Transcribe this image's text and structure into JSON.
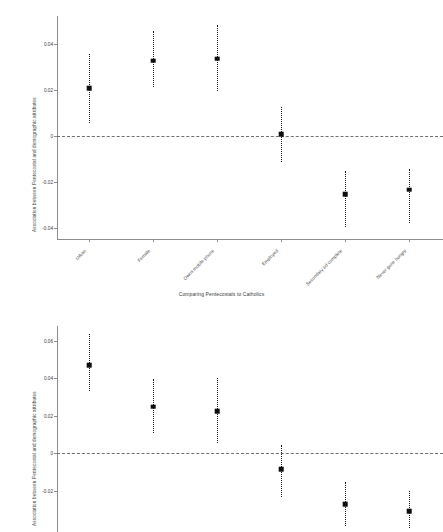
{
  "figure": {
    "caption": "Comparing Pentecostals to Catholics",
    "ylabel": "Association between Pentecostal and demographic attributes",
    "marker_color": "#0d0d0d",
    "errorbar_color": "#1a1a1a",
    "zeroline_color": "#6f6f6f",
    "axis_color": "#8d8d8d"
  },
  "chart_data": [
    {
      "type": "scatter",
      "panel": "top",
      "title": "",
      "subtitle": "Comparing Pentecostals to Catholics",
      "xlabel": "",
      "ylabel": "Association between Pentecostal and demographic attributes",
      "categories": [
        "Urban",
        "Female",
        "Owns mobile phone",
        "Employed",
        "Secondary ed complete",
        "Never gone hungry"
      ],
      "values": [
        0.0205,
        0.0325,
        0.0335,
        0.0007,
        -0.0255,
        -0.0235
      ],
      "ci_low": [
        0.0055,
        0.021,
        0.0195,
        -0.0115,
        -0.04,
        -0.038
      ],
      "ci_high": [
        0.0355,
        0.0455,
        0.048,
        0.0125,
        -0.0155,
        -0.0145
      ],
      "yticks": [
        0.04,
        0.02,
        0,
        -0.02,
        -0.04
      ],
      "ytick_labels": [
        "0.04",
        "0.02",
        "0",
        "-0.02",
        "-0.04"
      ],
      "ylim": [
        -0.045,
        0.052
      ],
      "grid": false,
      "legend": "none",
      "reference_line": 0,
      "reference_line_style": "dashed"
    },
    {
      "type": "scatter",
      "panel": "bottom",
      "title": "",
      "xlabel": "",
      "ylabel": "Association between Pentecostal and demographic attributes",
      "categories": [
        "Urban",
        "Female",
        "Owns mobile phone",
        "Employed",
        "Secondary ed complete",
        "Never gone hungry"
      ],
      "values": [
        0.047,
        0.025,
        0.0225,
        -0.0085,
        -0.027,
        -0.031
      ],
      "ci_low": [
        0.0335,
        0.011,
        0.0055,
        -0.0235,
        -0.039,
        -0.04
      ],
      "ci_high": [
        0.0635,
        0.0395,
        0.04,
        0.0042,
        -0.0155,
        -0.02
      ],
      "yticks": [
        0.06,
        0.04,
        0.02,
        0,
        -0.02
      ],
      "ytick_labels": [
        "0.06",
        "0.04",
        "0.02",
        "0",
        "-0.02"
      ],
      "ylim": [
        -0.042,
        0.068
      ],
      "grid": false,
      "legend": "none",
      "reference_line": 0,
      "reference_line_style": "dashed"
    }
  ]
}
